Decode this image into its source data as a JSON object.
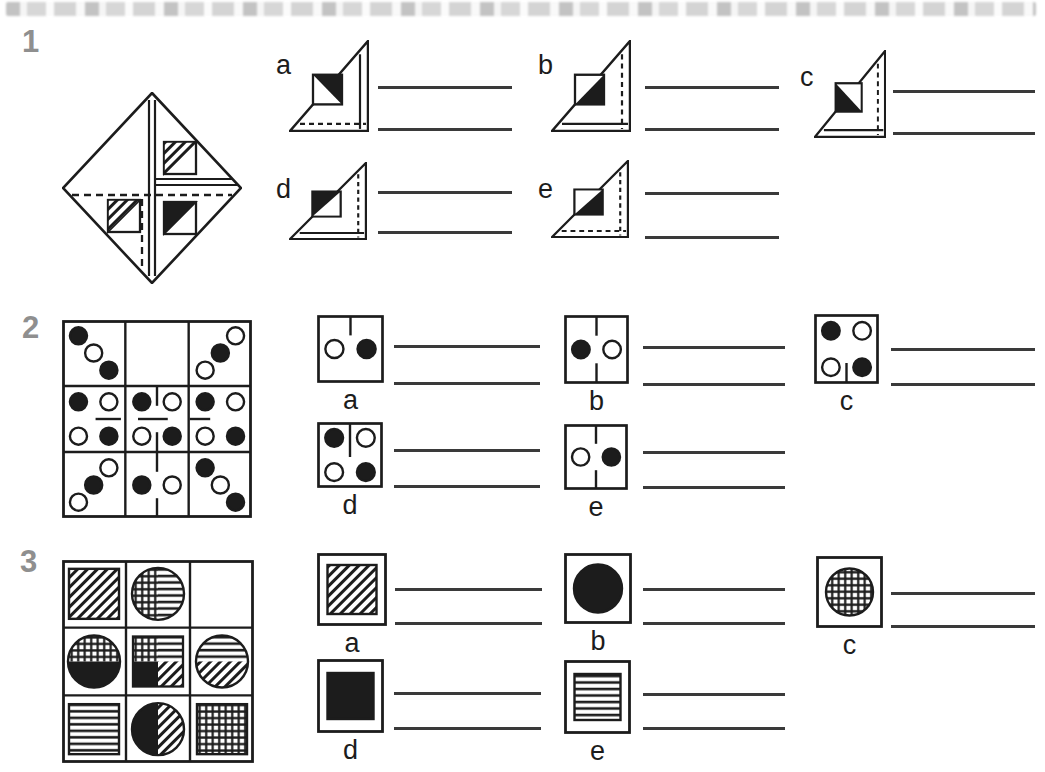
{
  "page": {
    "background": "#ffffff",
    "top_strip": {
      "description": "cropped remnant of previous printed line"
    }
  },
  "colors": {
    "ink": "#1c1c1c",
    "number_gray": "#8f8f8f",
    "answer_line": "#3a3a3a"
  },
  "questions": [
    {
      "number": "1",
      "stimulus": {
        "figure": "diamond-fold",
        "inner_squares": [
          {
            "position": "top-right",
            "shaded_half": "upper-left",
            "shading": "diagonal-hatch"
          },
          {
            "position": "bottom-left",
            "shaded_half": "upper-left",
            "shading": "diagonal-hatch"
          },
          {
            "position": "bottom-right",
            "shaded_half": "upper-left",
            "shading": "solid-black"
          }
        ],
        "fold_marks": [
          "double-vertical-center",
          "double-horizontal-right",
          "dashed-horizontal",
          "dashed-vertical-lower-left"
        ]
      },
      "options": [
        {
          "label": "a",
          "right_inner_line": "solid",
          "bottom_inner_line": "dashed",
          "black_half": "upper-right"
        },
        {
          "label": "b",
          "right_inner_line": "dashed",
          "bottom_inner_line": "solid",
          "black_half": "lower-right"
        },
        {
          "label": "c",
          "right_inner_line": "dashed",
          "bottom_inner_line": "solid",
          "black_half": "lower-left"
        },
        {
          "label": "d",
          "right_inner_line": "dashed",
          "bottom_inner_line": "solid",
          "black_half": "upper-left"
        },
        {
          "label": "e",
          "right_inner_line": "dashed",
          "bottom_inner_line": "dashed",
          "black_half": "lower-right"
        }
      ]
    },
    {
      "number": "2",
      "grid": [
        [
          {
            "dots": [
              [
                "tl",
                "black"
              ],
              [
                "c",
                "white"
              ],
              [
                "br",
                "black"
              ]
            ],
            "ticks": []
          },
          {
            "dots": [],
            "ticks": []
          },
          {
            "dots": [
              [
                "tr",
                "white"
              ],
              [
                "c",
                "black"
              ],
              [
                "bl",
                "white"
              ]
            ],
            "ticks": []
          }
        ],
        [
          {
            "dots": [
              [
                "tl",
                "black"
              ],
              [
                "tr",
                "white"
              ],
              [
                "bl",
                "white"
              ],
              [
                "br",
                "black"
              ]
            ],
            "ticks": [
              "mid-right-float"
            ]
          },
          {
            "dots": [
              [
                "tl",
                "black"
              ],
              [
                "tr",
                "white"
              ],
              [
                "bl",
                "white"
              ],
              [
                "br",
                "black"
              ]
            ],
            "ticks": [
              "top",
              "mid-center",
              "bottom"
            ]
          },
          {
            "dots": [
              [
                "tl",
                "black"
              ],
              [
                "tr",
                "white"
              ],
              [
                "bl",
                "white"
              ],
              [
                "br",
                "black"
              ]
            ],
            "ticks": [
              "mid-left"
            ]
          }
        ],
        [
          {
            "dots": [
              [
                "tr",
                "white"
              ],
              [
                "c",
                "black"
              ],
              [
                "bl",
                "white"
              ]
            ],
            "ticks": []
          },
          {
            "dots": [
              [
                "ml",
                "black"
              ],
              [
                "mr",
                "white"
              ]
            ],
            "ticks": [
              "top",
              "bottom"
            ]
          },
          {
            "dots": [
              [
                "tl",
                "black"
              ],
              [
                "c",
                "white"
              ],
              [
                "br",
                "black"
              ]
            ],
            "ticks": []
          }
        ]
      ],
      "options": [
        {
          "label": "a",
          "dots": [
            [
              "ml",
              "white"
            ],
            [
              "mr",
              "black"
            ]
          ],
          "ticks": [
            "top"
          ]
        },
        {
          "label": "b",
          "dots": [
            [
              "ml",
              "black"
            ],
            [
              "mr",
              "white"
            ]
          ],
          "ticks": [
            "top",
            "bottom"
          ]
        },
        {
          "label": "c",
          "dots": [
            [
              "tl",
              "black"
            ],
            [
              "tr",
              "white"
            ],
            [
              "bl",
              "white"
            ],
            [
              "br",
              "black"
            ]
          ],
          "ticks": [
            "bottom"
          ]
        },
        {
          "label": "d",
          "dots": [
            [
              "tl",
              "black"
            ],
            [
              "tr",
              "white"
            ],
            [
              "bl",
              "white"
            ],
            [
              "br",
              "black"
            ]
          ],
          "ticks": [
            "top-long"
          ]
        },
        {
          "label": "e",
          "dots": [
            [
              "ml",
              "white"
            ],
            [
              "mr",
              "black"
            ]
          ],
          "ticks": [
            "top",
            "bottom"
          ]
        }
      ]
    },
    {
      "number": "3",
      "grid": [
        [
          {
            "shape": "square",
            "fill": "diag"
          },
          {
            "shape": "circle",
            "halves": {
              "left": "cross",
              "right": "hstripe"
            }
          },
          {
            "shape": "none"
          }
        ],
        [
          {
            "shape": "circle",
            "halves": {
              "top": "cross",
              "bottom": "black"
            }
          },
          {
            "shape": "square",
            "quads": {
              "tl": "cross",
              "tr": "hstripe",
              "bl": "black",
              "br": "diag"
            }
          },
          {
            "shape": "circle",
            "halves": {
              "top": "hstripe",
              "bottom": "diag"
            }
          }
        ],
        [
          {
            "shape": "square",
            "fill": "hstripe"
          },
          {
            "shape": "circle",
            "halves": {
              "left": "black",
              "right": "diag"
            }
          },
          {
            "shape": "square",
            "fill": "cross"
          }
        ]
      ],
      "options": [
        {
          "label": "a",
          "shape": "square",
          "fill": "diag"
        },
        {
          "label": "b",
          "shape": "circle",
          "fill": "black"
        },
        {
          "label": "c",
          "shape": "circle",
          "fill": "cross"
        },
        {
          "label": "d",
          "shape": "square",
          "fill": "black"
        },
        {
          "label": "e",
          "shape": "square",
          "fill": "hstripe"
        }
      ]
    }
  ]
}
